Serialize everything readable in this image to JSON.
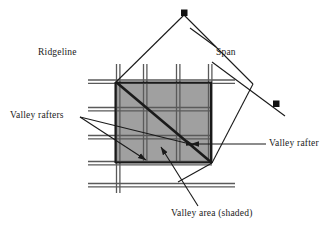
{
  "figure": {
    "type": "architectural-roof-framing-diagram",
    "background_color": "#ffffff",
    "line_color": "#1a1a1a",
    "rafter_color": "#5a5a5a",
    "shade_color": "#a0a0a0",
    "marker_color": "#111111"
  },
  "labels": {
    "ridgeline": "Ridgeline",
    "span": "Span",
    "valley_rafters": "Valley rafters",
    "valley_rafter": "Valley rafter",
    "valley_area": "Valley area (shaded)"
  },
  "geometry": {
    "valley_area": {
      "x": 116,
      "y": 82,
      "width": 96,
      "height": 81
    },
    "diamond_apex_top": {
      "x": 184,
      "y": 13
    },
    "diamond_marker_right": {
      "x": 276,
      "y": 104
    },
    "valley_rafter_diagonal": {
      "x1": 117,
      "y1": 83,
      "x2": 211,
      "y2": 162
    },
    "horizontal_rafters_y": [
      81,
      109,
      137,
      164,
      185
    ],
    "vertical_rafters_x": [
      118,
      145,
      178,
      210
    ],
    "rafter_left_extent": 88,
    "rafter_right_extent": 235
  },
  "markers": {
    "square_size": 6,
    "count": 2
  },
  "leaders": [
    {
      "name": "valley-rafters-leader-upper",
      "from": [
        78,
        116
      ],
      "to": [
        146,
        161
      ]
    },
    {
      "name": "valley-rafters-leader-lower",
      "from": [
        78,
        116
      ],
      "to": [
        196,
        145
      ]
    },
    {
      "name": "valley-area-leader",
      "from": [
        196,
        205
      ],
      "to": [
        160,
        148
      ]
    },
    {
      "name": "valley-rafter-leader",
      "from": [
        266,
        144
      ],
      "to": [
        190,
        144
      ]
    },
    {
      "name": "span-leader",
      "from": [
        212,
        48
      ],
      "to": [
        192,
        34
      ]
    }
  ]
}
